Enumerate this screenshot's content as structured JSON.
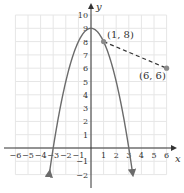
{
  "chart_data": {
    "type": "line",
    "title": "",
    "xlabel": "x",
    "ylabel": "y",
    "xlim": [
      -6,
      6
    ],
    "ylim": [
      -2,
      10
    ],
    "grid": true,
    "x_ticks": [
      -6,
      -5,
      -4,
      -3,
      -2,
      -1,
      1,
      2,
      3,
      4,
      5,
      6
    ],
    "y_ticks": [
      -2,
      -1,
      1,
      2,
      3,
      4,
      5,
      6,
      7,
      8,
      9,
      10
    ],
    "series": [
      {
        "name": "parabola",
        "equation": "y = 9 - x^2",
        "style": "solid",
        "color": "#6b6b6b",
        "arrows": "both-ends",
        "x": [
          -3.3,
          -3,
          -2,
          -1,
          0,
          1,
          2,
          3,
          3.3
        ],
        "y": [
          -1.89,
          0,
          5,
          8,
          9,
          8,
          5,
          0,
          -1.89
        ]
      },
      {
        "name": "segment",
        "style": "dashed",
        "color": "#333333",
        "x": [
          1,
          6
        ],
        "y": [
          8,
          6
        ]
      }
    ],
    "points": [
      {
        "label": "(1, 8)",
        "x": 1,
        "y": 8
      },
      {
        "label": "(6, 6)",
        "x": 6,
        "y": 6
      }
    ]
  },
  "labels": {
    "x_axis": "x",
    "y_axis": "y",
    "point_a": "(1, 8)",
    "point_b": "(6, 6)",
    "x_tick_labels": [
      "−6",
      "−5",
      "−4",
      "−3",
      "−2",
      "−1",
      "1",
      "2",
      "3",
      "4",
      "5",
      "6"
    ],
    "y_tick_labels": [
      "10",
      "9",
      "8",
      "7",
      "6",
      "5",
      "4",
      "3",
      "2",
      "1",
      "−1",
      "−2"
    ]
  },
  "colors": {
    "grid": "#e6e6e6",
    "axis": "#333333",
    "curve": "#6b6b6b",
    "point": "#8a8a8a",
    "dashed": "#333333"
  }
}
